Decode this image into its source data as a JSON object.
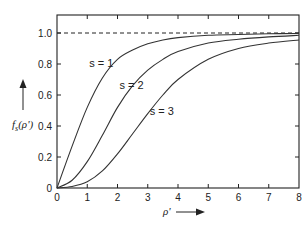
{
  "chart_data": {
    "type": "line",
    "title": "",
    "xlabel": "ρ'",
    "ylabel": "f_s(ρ')",
    "xlim": [
      0,
      8
    ],
    "ylim": [
      0,
      1.08
    ],
    "grid": false,
    "legend": "inline curve labels",
    "x_ticks": [
      "0",
      "1",
      "2",
      "3",
      "4",
      "5",
      "6",
      "7",
      "8"
    ],
    "y_ticks": [
      "0",
      "0.2",
      "0.4",
      "0.6",
      "0.8",
      "1.0"
    ],
    "reference_line": {
      "y": 1.0,
      "style": "dashed"
    },
    "x": [
      0,
      0.5,
      1,
      1.5,
      2,
      2.5,
      3,
      3.5,
      4,
      5,
      6,
      7,
      8
    ],
    "series": [
      {
        "name": "s = 1",
        "values": [
          0,
          0.27,
          0.52,
          0.71,
          0.83,
          0.89,
          0.93,
          0.955,
          0.97,
          0.985,
          0.99,
          0.995,
          0.997
        ]
      },
      {
        "name": "s = 2",
        "values": [
          0,
          0.05,
          0.17,
          0.34,
          0.52,
          0.66,
          0.76,
          0.83,
          0.88,
          0.935,
          0.96,
          0.975,
          0.985
        ]
      },
      {
        "name": "s = 3",
        "values": [
          0,
          0.01,
          0.04,
          0.11,
          0.22,
          0.35,
          0.48,
          0.6,
          0.7,
          0.83,
          0.9,
          0.935,
          0.955
        ]
      }
    ],
    "annotations": [
      {
        "text": "s = 1",
        "x": 1.0,
        "y": 0.78
      },
      {
        "text": "s = 2",
        "x": 2.0,
        "y": 0.64
      },
      {
        "text": "s = 3",
        "x": 3.0,
        "y": 0.47
      }
    ]
  },
  "labels": {
    "x_axis": "ρ'",
    "y_axis_main": "f",
    "y_axis_sub": "s",
    "y_axis_arg": "(ρ')"
  }
}
